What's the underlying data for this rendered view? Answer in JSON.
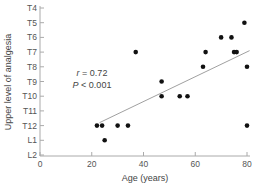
{
  "chart_data": {
    "type": "scatter",
    "title": "",
    "xlabel": "Age (years)",
    "ylabel": "Upper level of analgesia",
    "xlim": [
      0,
      80
    ],
    "x_ticks": [
      0,
      20,
      40,
      60,
      80
    ],
    "y_categories": [
      "T4",
      "T5",
      "T6",
      "T7",
      "T8",
      "T9",
      "T10",
      "T11",
      "T12",
      "L1",
      "L2"
    ],
    "grid": false,
    "legend": "none",
    "points": [
      {
        "x": 22,
        "y": "T12"
      },
      {
        "x": 24,
        "y": "T12"
      },
      {
        "x": 25,
        "y": "L1"
      },
      {
        "x": 30,
        "y": "T12"
      },
      {
        "x": 34,
        "y": "T12"
      },
      {
        "x": 37,
        "y": "T7"
      },
      {
        "x": 47,
        "y": "T9"
      },
      {
        "x": 47,
        "y": "T10"
      },
      {
        "x": 54,
        "y": "T10"
      },
      {
        "x": 57,
        "y": "T10"
      },
      {
        "x": 63,
        "y": "T8"
      },
      {
        "x": 64,
        "y": "T7"
      },
      {
        "x": 70,
        "y": "T6"
      },
      {
        "x": 74,
        "y": "T6"
      },
      {
        "x": 75,
        "y": "T7"
      },
      {
        "x": 76,
        "y": "T7"
      },
      {
        "x": 79,
        "y": "T5"
      },
      {
        "x": 80,
        "y": "T8"
      },
      {
        "x": 80,
        "y": "T12"
      }
    ],
    "regression_line": {
      "start": {
        "x": 23,
        "y_index": 7.8
      },
      "end": {
        "x": 81,
        "y_index": 2.9
      }
    },
    "annotations": {
      "r_label": "r",
      "r_value": " = 0.72",
      "p_label": "P",
      "p_value": " < 0.001"
    },
    "colors": {
      "points": "#111111",
      "line": "#888888",
      "axis": "#aaaaaa"
    }
  }
}
